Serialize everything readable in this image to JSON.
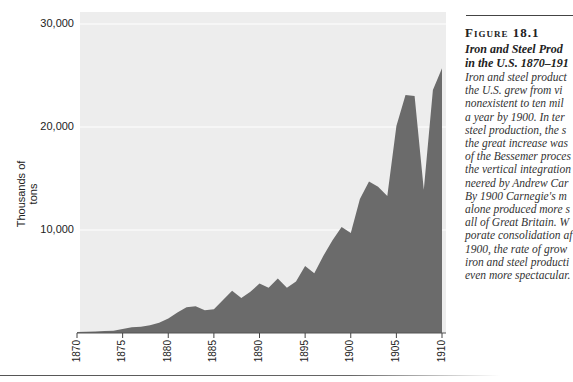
{
  "chart_data": {
    "type": "area",
    "xlabel": "",
    "ylabel": "Thousands of tons",
    "ylim": [
      0,
      30000
    ],
    "xlim": [
      1870,
      1910
    ],
    "grid": true,
    "yticks": [
      10000,
      20000,
      30000
    ],
    "ytick_labels": [
      "10,000",
      "20,000",
      "30,000"
    ],
    "xticks": [
      1870,
      1875,
      1880,
      1885,
      1890,
      1895,
      1900,
      1905,
      1910
    ],
    "x": [
      1870,
      1871,
      1872,
      1873,
      1874,
      1875,
      1876,
      1877,
      1878,
      1879,
      1880,
      1881,
      1882,
      1883,
      1884,
      1885,
      1886,
      1887,
      1888,
      1889,
      1890,
      1891,
      1892,
      1893,
      1894,
      1895,
      1896,
      1897,
      1898,
      1899,
      1900,
      1901,
      1902,
      1903,
      1904,
      1905,
      1906,
      1907,
      1908,
      1909,
      1910
    ],
    "series": [
      {
        "name": "Iron and steel production (thousands of tons)",
        "values": [
          100,
          130,
          160,
          200,
          220,
          400,
          550,
          600,
          750,
          1000,
          1400,
          2000,
          2500,
          2600,
          2200,
          2300,
          3200,
          4100,
          3400,
          4000,
          4800,
          4400,
          5300,
          4400,
          5000,
          6500,
          5800,
          7500,
          9000,
          10300,
          9700,
          13000,
          14700,
          14200,
          13300,
          20100,
          23100,
          23000,
          13900,
          23600,
          25700
        ]
      }
    ],
    "colors": {
      "area": "#6b6b6b",
      "plot_background": "#ededed",
      "gridline": "#ffffff"
    }
  },
  "axis": {
    "ylabel": "Thousands of tons",
    "yticks": [
      "30,000",
      "20,000",
      "10,000"
    ],
    "xticks": [
      "1870",
      "1875",
      "1880",
      "1885",
      "1890",
      "1895",
      "1900",
      "1905",
      "1910"
    ]
  },
  "caption": {
    "figure_number": "Figure 18.1",
    "title_lines": [
      "Iron and Steel Prod",
      "in the U.S. 1870–191"
    ],
    "body_lines": [
      "Iron and steel product",
      "the U.S. grew from vi",
      "nonexistent to ten mil",
      "a year by 1900. In ter",
      "steel production, the s",
      "the great increase was",
      "of the Bessemer proces",
      "the vertical integration",
      "neered by Andrew Car",
      "By 1900 Carnegie's m",
      "alone produced more s",
      "all of Great Britain. W",
      "porate consolidation af",
      "1900, the rate of grow",
      "iron and steel producti",
      "even more spectacular."
    ]
  }
}
